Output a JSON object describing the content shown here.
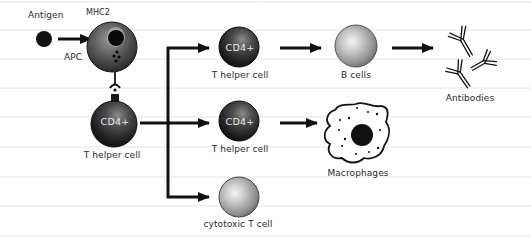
{
  "diagram": {
    "type": "immune-response-flow",
    "background": {
      "paper": "#ffffff",
      "rule_color": "#e4e4e4",
      "rule_spacing_px": 29.3
    },
    "nodes": [
      {
        "id": "antigen",
        "label": "Antigen",
        "shape": "small-dot",
        "color": "#111111"
      },
      {
        "id": "apc",
        "label": "APC",
        "receptor_label": "MHC2",
        "shape": "cell-dark"
      },
      {
        "id": "t_helper_origin",
        "label": "T helper cell",
        "marker": "CD4+",
        "shape": "cell-dark"
      },
      {
        "id": "t_helper_top",
        "label": "T helper cell",
        "marker": "CD4+",
        "shape": "cell-dark"
      },
      {
        "id": "b_cells",
        "label": "B cells",
        "shape": "cell-light"
      },
      {
        "id": "antibodies",
        "label": "Antibodies",
        "shape": "antibody-glyphs",
        "count": 3
      },
      {
        "id": "t_helper_mid",
        "label": "T helper cell",
        "marker": "CD4+",
        "shape": "cell-dark"
      },
      {
        "id": "macrophages",
        "label": "Macrophages",
        "shape": "amoeboid-cell"
      },
      {
        "id": "cytotoxic_t",
        "label": "cytotoxic T cell",
        "shape": "cell-light"
      }
    ],
    "edges": [
      {
        "from": "antigen",
        "to": "apc",
        "kind": "arrow"
      },
      {
        "from": "apc",
        "to": "t_helper_origin",
        "kind": "receptor-binding"
      },
      {
        "from": "t_helper_origin",
        "to": "t_helper_top",
        "kind": "branch-arrow"
      },
      {
        "from": "t_helper_origin",
        "to": "t_helper_mid",
        "kind": "branch-arrow"
      },
      {
        "from": "t_helper_origin",
        "to": "cytotoxic_t",
        "kind": "branch-arrow"
      },
      {
        "from": "t_helper_top",
        "to": "b_cells",
        "kind": "arrow"
      },
      {
        "from": "b_cells",
        "to": "antibodies",
        "kind": "arrow"
      },
      {
        "from": "t_helper_mid",
        "to": "macrophages",
        "kind": "arrow"
      }
    ]
  },
  "labels": {
    "antigen": "Antigen",
    "mhc2": "MHC2",
    "apc": "APC",
    "t_helper_origin": "T helper cell",
    "t_helper_top": "T helper cell",
    "t_helper_mid": "T helper cell",
    "b_cells": "B cells",
    "antibodies": "Antibodies",
    "macrophages": "Macrophages",
    "cytotoxic_t": "cytotoxic T cell",
    "cd4_marker": "CD4+"
  }
}
